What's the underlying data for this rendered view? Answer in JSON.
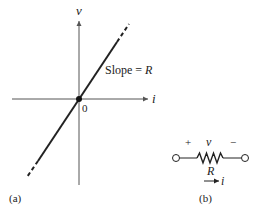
{
  "figure_a": {
    "label": "(a)",
    "y_axis_label": "v",
    "x_axis_label": "i",
    "origin_label": "0",
    "line_annotation_prefix": "Slope = ",
    "line_annotation_var": "R"
  },
  "figure_b": {
    "label": "(b)",
    "plus_sign": "+",
    "voltage_label": "v",
    "minus_sign": "−",
    "resistor_label": "R",
    "current_label": "i"
  },
  "colors": {
    "stroke": "#222222",
    "axis": "#555555"
  }
}
